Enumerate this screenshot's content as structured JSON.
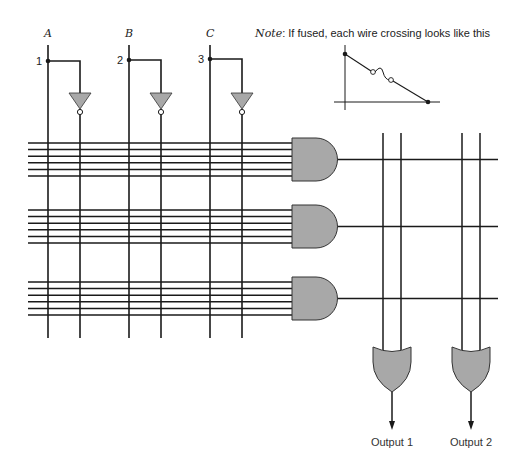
{
  "diagram": {
    "type": "PLA (programmable logic array) fuse map",
    "inputs": [
      {
        "name": "A",
        "pin": "1",
        "x": 48,
        "inv_x": 80
      },
      {
        "name": "B",
        "pin": "2",
        "x": 129,
        "inv_x": 161
      },
      {
        "name": "C",
        "pin": "3",
        "x": 210,
        "inv_x": 242
      }
    ],
    "note": {
      "prefix": "Note",
      "text": ": If fused, each wire crossing looks like this"
    },
    "and_gates": [
      {
        "id": "and-1",
        "row_top": 143,
        "output_y": 155
      },
      {
        "id": "and-2",
        "row_top": 210,
        "output_y": 225
      },
      {
        "id": "and-3",
        "row_top": 282,
        "output_y": 296
      }
    ],
    "and_inputs_per_gate": 6,
    "or_gates": [
      {
        "id": "or-1",
        "label": "Output 1",
        "x1": 383,
        "x2": 401,
        "cx": 392
      },
      {
        "id": "or-2",
        "label": "Output 2",
        "x1": 462,
        "x2": 480,
        "cx": 471
      }
    ],
    "colors": {
      "wire": "#1a1a1a",
      "gate_fill": "#a8a8a8",
      "gate_stroke": "#333333",
      "background": "#ffffff"
    }
  }
}
